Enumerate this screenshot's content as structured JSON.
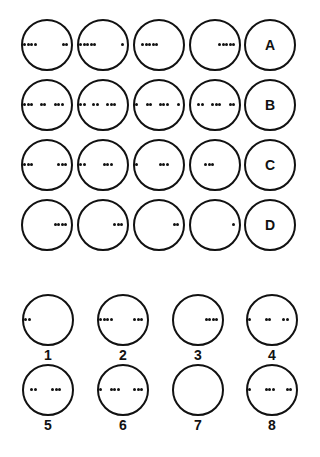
{
  "puzzle": {
    "grid_rows": [
      {
        "label": "A",
        "cells": [
          {
            "dots": [
              0.0,
              0.08,
              0.16,
              0.24,
              0.88,
              0.96
            ]
          },
          {
            "dots": [
              0.0,
              0.08,
              0.16,
              0.24,
              0.32,
              0.96
            ]
          },
          {
            "dots": [
              0.14,
              0.22,
              0.3,
              0.38,
              0.46
            ]
          },
          {
            "dots": [
              0.62,
              0.7,
              0.78,
              0.86,
              0.94
            ]
          }
        ]
      },
      {
        "label": "B",
        "cells": [
          {
            "dots": [
              0.0,
              0.08,
              0.16,
              0.38,
              0.46,
              0.7,
              0.78,
              0.86
            ]
          },
          {
            "dots": [
              0.0,
              0.08,
              0.3,
              0.38,
              0.62,
              0.7,
              0.78
            ]
          },
          {
            "dots": [
              0.0,
              0.24,
              0.32,
              0.54,
              0.62,
              0.7,
              0.96
            ]
          },
          {
            "dots": [
              0.14,
              0.22,
              0.46,
              0.54,
              0.62,
              0.86,
              0.94
            ]
          }
        ]
      },
      {
        "label": "C",
        "cells": [
          {
            "dots": [
              0.0,
              0.08,
              0.16,
              0.78,
              0.86,
              0.94
            ]
          },
          {
            "dots": [
              0.0,
              0.08,
              0.54,
              0.62,
              0.7
            ]
          },
          {
            "dots": [
              0.0,
              0.54,
              0.62,
              0.7
            ]
          },
          {
            "dots": [
              0.3,
              0.38,
              0.46
            ]
          }
        ]
      },
      {
        "label": "D",
        "cells": [
          {
            "dots": [
              0.7,
              0.78,
              0.86,
              0.94
            ]
          },
          {
            "dots": [
              0.78,
              0.86,
              0.94
            ]
          },
          {
            "dots": [
              0.86,
              0.94
            ]
          },
          {
            "dots": [
              0.94
            ]
          }
        ]
      }
    ],
    "answers": [
      {
        "number": "1",
        "dots": [
          0.0,
          0.08
        ]
      },
      {
        "number": "2",
        "dots": [
          0.0,
          0.08,
          0.16,
          0.24,
          0.78,
          0.86,
          0.94
        ]
      },
      {
        "number": "3",
        "dots": [
          0.7,
          0.78,
          0.86,
          0.94
        ]
      },
      {
        "number": "4",
        "dots": [
          0.0,
          0.38,
          0.46,
          0.78,
          0.86
        ]
      },
      {
        "number": "5",
        "dots": [
          0.14,
          0.22,
          0.62,
          0.7,
          0.78
        ]
      },
      {
        "number": "6",
        "dots": [
          0.0,
          0.24,
          0.32,
          0.4,
          0.78,
          0.86,
          0.94
        ]
      },
      {
        "number": "7",
        "dots": []
      },
      {
        "number": "8",
        "dots": [
          0.0,
          0.38,
          0.46,
          0.54,
          0.86,
          0.94
        ]
      }
    ]
  }
}
